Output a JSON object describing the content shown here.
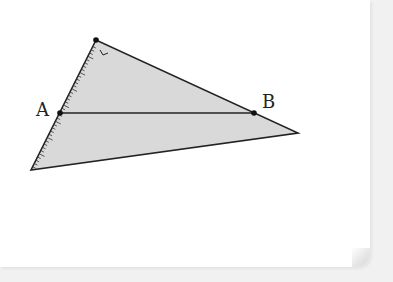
{
  "figure": {
    "type": "triangle-diagram",
    "fill_color": "#d9d9d9",
    "stroke_color": "#222222",
    "vertices": {
      "top": [
        96,
        40
      ],
      "bottom_left": [
        31,
        170
      ],
      "right": [
        298,
        133
      ]
    },
    "points": [
      {
        "label": "A",
        "x": 60,
        "y": 113
      },
      {
        "label": "B",
        "x": 254,
        "y": 113
      }
    ],
    "segment": {
      "from": "A",
      "to": "B"
    },
    "right_angle_marker_at": "top",
    "ruler_ticks_on": "left edge (top to bottom_left)"
  },
  "labels": {
    "A": "A",
    "B": "B"
  }
}
